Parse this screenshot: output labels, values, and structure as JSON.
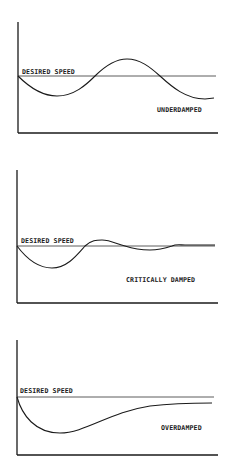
{
  "panels": [
    {
      "id": "underdamped",
      "reference_label": "DESIRED SPEED",
      "response_label": "UNDERDAMPED"
    },
    {
      "id": "critically-damped",
      "reference_label": "DESIRED SPEED",
      "response_label": "CRITICALLY DAMPED"
    },
    {
      "id": "overdamped",
      "reference_label": "DESIRED SPEED",
      "response_label": "OVERDAMPED"
    }
  ],
  "colors": {
    "line": "#1a1a1a",
    "background": "#ffffff"
  }
}
